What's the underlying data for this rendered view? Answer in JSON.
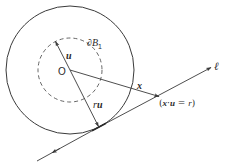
{
  "figure": {
    "type": "geometric-diagram",
    "stroke_color": "#3a3a3a",
    "background": "#ffffff"
  },
  "labels": {
    "origin": "O",
    "unit_vector": "u",
    "unit_sphere": "∂B",
    "unit_sphere_sub": "1",
    "scaled_vector_r": "r",
    "scaled_vector_u": "u",
    "position_vector": "x",
    "line_name": "ℓ",
    "condition_open": "(",
    "condition_x": "x",
    "condition_dot": "·",
    "condition_u": "u",
    "condition_eq": " = ",
    "condition_r": "r",
    "condition_close": ")"
  },
  "geometry": {
    "origin": [
      70,
      70
    ],
    "outer_circle_radius": 64,
    "dashed_circle_radius": 32,
    "u_tip": [
      55,
      42
    ],
    "tangent_point": [
      99,
      127
    ],
    "x_tip": [
      160,
      97
    ],
    "line_start": [
      36,
      162
    ],
    "line_end": [
      212,
      67
    ]
  }
}
